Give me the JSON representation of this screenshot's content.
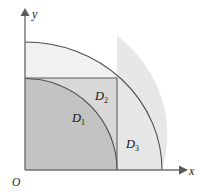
{
  "figure": {
    "background_color": "#ffffff",
    "width": 204,
    "height": 194
  },
  "axes": {
    "origin_label": "O",
    "x_label": "x",
    "y_label": "y",
    "axis_color": "#6b6b6b",
    "origin_point": {
      "x": 25,
      "y": 170
    },
    "x_axis_end": {
      "x": 184,
      "y": 170
    },
    "y_axis_end": {
      "x": 25,
      "y": 10
    }
  },
  "regions": [
    {
      "id": "D1",
      "label": "D",
      "subscript": "1",
      "description": "quarter disc of small radius inside the square",
      "fill_color": "#c3c3c3",
      "label_position": {
        "x": 73,
        "y": 120
      }
    },
    {
      "id": "D2",
      "label": "D",
      "subscript": "2",
      "description": "part of the square outside the small quarter disc",
      "fill_color": "#d8d8d8",
      "label_position": {
        "x": 95,
        "y": 100
      }
    },
    {
      "id": "D3",
      "label": "D",
      "subscript": "3",
      "description": "part of the large quarter disc to the right of the square",
      "fill_color": "#e9e9e9",
      "label_position": {
        "x": 127,
        "y": 147
      }
    }
  ],
  "outer_sector": {
    "description": "large quarter disc above and right of the square",
    "fill_color": "#f0f0f0",
    "radius": 137,
    "stroke_color": "#4a4a4a"
  },
  "inner_arc": {
    "description": "small quarter circle arc",
    "radius": 91,
    "stroke_color": "#3c3c3c"
  },
  "square": {
    "description": "square with corner at origin",
    "side": 92,
    "stroke_color": "#5a5a5a",
    "top_left": {
      "x": 25,
      "y": 78
    },
    "bottom_right": {
      "x": 117,
      "y": 170
    }
  }
}
